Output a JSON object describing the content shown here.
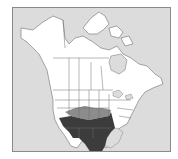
{
  "map": {
    "type": "range-map",
    "region": "North America",
    "colors": {
      "ocean": "#dcdcdc",
      "land": "#ffffff",
      "borders": "#6f6f6f",
      "range_primary": "#3c3c3c",
      "range_secondary": "#8c8c8c",
      "frame": "#8a8a8a"
    },
    "legend": [
      {
        "label": "dark range",
        "color": "#3c3c3c"
      },
      {
        "label": "light range",
        "color": "#8c8c8c"
      }
    ]
  }
}
